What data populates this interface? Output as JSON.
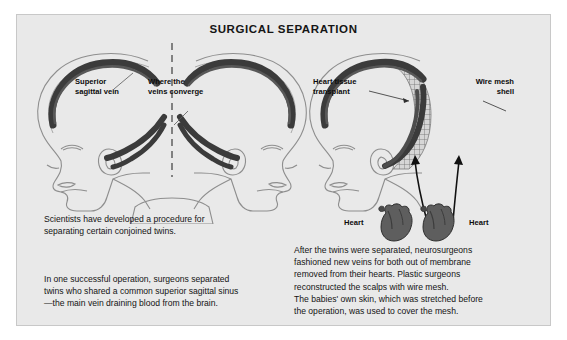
{
  "title": "SURGICAL SEPARATION",
  "diagram": {
    "left_panel": {
      "caption_role": "conjoined-twins-before-separation",
      "labels": [
        {
          "id": "superior-sagittal-vein",
          "text": "Superior\nsagittal vein"
        },
        {
          "id": "veins-converge",
          "text": "Where the\nveins converge"
        }
      ],
      "cut_line": "dashed vertical separation plane"
    },
    "right_panel": {
      "caption_role": "twins-after-separation",
      "labels": [
        {
          "id": "heart-tissue-transplant",
          "text": "Heart tissue\ntransplant"
        },
        {
          "id": "wire-mesh-shell",
          "text": "Wire mesh\nshell"
        },
        {
          "id": "heart-left",
          "text": "Heart"
        },
        {
          "id": "heart-right",
          "text": "Heart"
        }
      ]
    }
  },
  "body": {
    "left_1": "Scientists have developed a procedure for\nseparating certain conjoined twins.",
    "left_2": "In one successful operation, surgeons separated\ntwins who shared a common superior sagittal sinus\n—the main vein draining blood from the brain.",
    "right": "After the twins were separated, neurosurgeons\nfashioned new veins for both out of membrane\nremoved from their hearts. Plastic surgeons\nreconstructed the scalps with wire mesh.\nThe babies' own skin, which was stretched before\nthe operation, was used to cover the mesh."
  },
  "colors": {
    "panel_background": "#e9e9e9",
    "page_background": "#ffffff",
    "vein_dark": "#3b3b3b",
    "outline": "#8e8e8e",
    "text": "#141414",
    "heart": "#5a5a5a"
  }
}
